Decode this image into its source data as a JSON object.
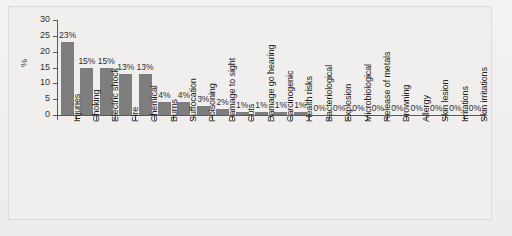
{
  "chart_data": {
    "type": "bar",
    "title": "",
    "subtitle": "",
    "xlabel": "",
    "ylabel": "%",
    "ylim": [
      0,
      30
    ],
    "yticks": [
      0,
      5,
      10,
      15,
      20,
      25,
      30
    ],
    "grid": false,
    "legend": null,
    "orientation": "vertical",
    "bar_color": "#7e7e7e",
    "value_label_suffix": "%",
    "categories": [
      "Injuries",
      "Choking",
      "Electric shock",
      "Fire",
      "Chemical",
      "Burns",
      "Suffocation",
      "Poisoning",
      "Damage to sight",
      "Cuts",
      "Damage go hearing",
      "Carcinogenic",
      "Health risks",
      "Bacteriological",
      "Explosion",
      "Microbiological",
      "Release of metals",
      "Drowning",
      "Allergy",
      "Skin lesion",
      "Irritations",
      "Skin irritations"
    ],
    "values": [
      23,
      15,
      15,
      13,
      13,
      4,
      4,
      3,
      2,
      1,
      1,
      1,
      1,
      0,
      0,
      0,
      0,
      0,
      0,
      0,
      0,
      0
    ],
    "value_labels": [
      "23%",
      "15%",
      "15%",
      "13%",
      "13%",
      "4%",
      "4%",
      "3%",
      "2%",
      "1%",
      "1%",
      "1%",
      "1%",
      "0%",
      "0%",
      "0%",
      "0%",
      "0%",
      "0%",
      "0%",
      "0%",
      "0%"
    ],
    "ytick_labels": [
      "0",
      "5",
      "10",
      "15",
      "20",
      "25",
      "30"
    ]
  }
}
